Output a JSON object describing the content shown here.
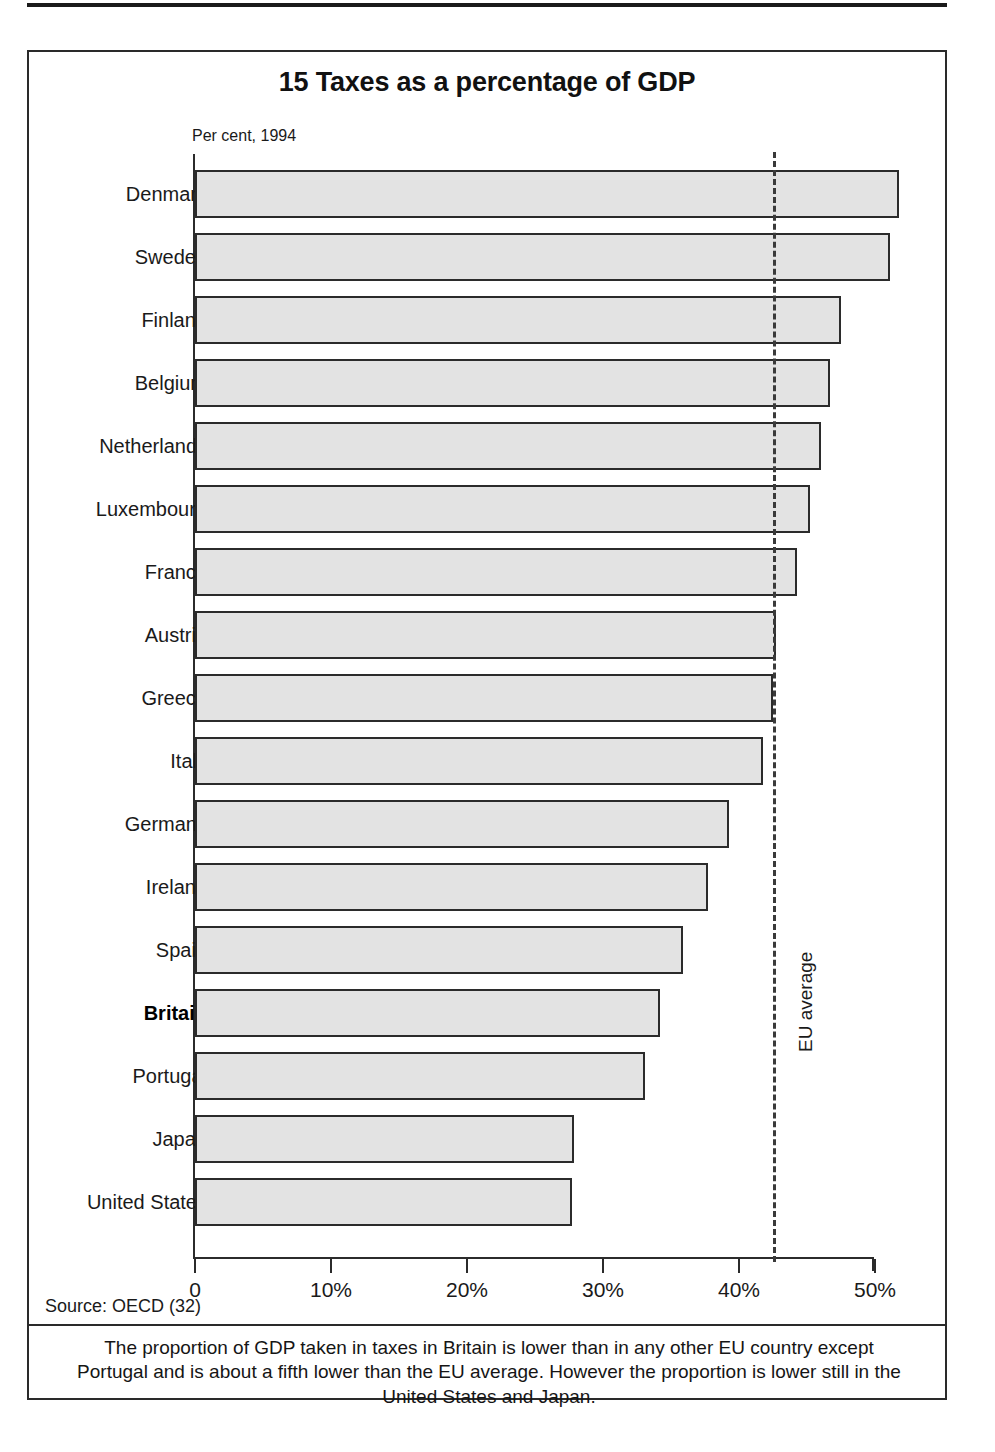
{
  "figure": {
    "title": "15 Taxes as a percentage of GDP",
    "axis_note": "Per cent, 1994",
    "source": "Source: OECD (32)",
    "caption": "The proportion of GDP taken in taxes in Britain is lower than in any other EU country except Portugal and is about a fifth lower than the EU average. However the proportion is lower still in the United States and Japan.",
    "reference_label": "EU average",
    "colors": {
      "bar_fill": "#e3e3e3",
      "bar_stroke": "#2b2b2b",
      "axis": "#2b2b2b",
      "frame": "#2a2a2a",
      "text": "#1a1a1a"
    }
  },
  "chart_data": {
    "type": "bar",
    "orientation": "horizontal",
    "title": "15 Taxes as a percentage of GDP",
    "subtitle": "Per cent, 1994",
    "xlabel": "",
    "ylabel": "",
    "xlim": [
      0,
      50
    ],
    "grid": false,
    "legend": null,
    "tick_labels": [
      "0",
      "10%",
      "20%",
      "30%",
      "40%",
      "50%"
    ],
    "tick_values": [
      0,
      10,
      20,
      30,
      40,
      50
    ],
    "categories": [
      "Denmark",
      "Sweden",
      "Finland",
      "Belgium",
      "Netherlands",
      "Luxembourg",
      "France",
      "Austria",
      "Greece",
      "Italy",
      "Germany",
      "Ireland",
      "Spain",
      "Britain",
      "Portugal",
      "Japan",
      "United States"
    ],
    "values": [
      51.8,
      51.1,
      47.5,
      46.7,
      46.0,
      45.2,
      44.3,
      42.7,
      42.5,
      41.8,
      39.3,
      37.7,
      35.9,
      34.2,
      33.1,
      27.9,
      27.7
    ],
    "highlight_category": "Britain",
    "annotations": [
      {
        "name": "EU average",
        "type": "vline",
        "value": 42.5,
        "style": "dashed"
      }
    ]
  }
}
